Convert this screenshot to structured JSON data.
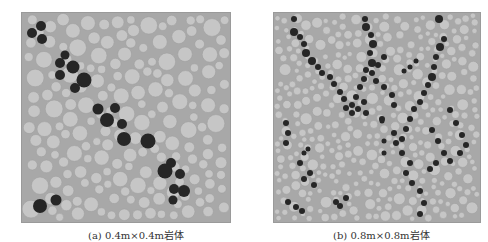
{
  "figures": [
    {
      "id": "a",
      "caption": "(a) 0.4m×0.4m岩体",
      "description": "Circular particle packing, 0.4m x 0.4m rock mass; dark particles form a diagonal band from top-left to bottom-right",
      "colors": {
        "background": "#a8a8a8",
        "particle": "#c6c6c6",
        "particle_edge": "#9c9c9c",
        "marked_particle": "#262626"
      }
    },
    {
      "id": "b",
      "caption": "(b) 0.8m×0.8m岩体",
      "description": "Circular particle packing, 0.8m x 0.8m rock mass; dark particles form crossing chains (X / V shaped pattern)",
      "colors": {
        "background": "#a8a8a8",
        "particle": "#c6c6c6",
        "particle_edge": "#9c9c9c",
        "marked_particle": "#262626"
      }
    }
  ]
}
